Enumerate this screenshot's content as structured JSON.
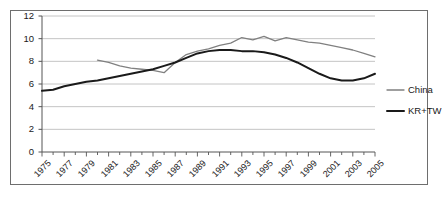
{
  "chart_data": {
    "type": "line",
    "title": "",
    "subtitle": "",
    "xlabel": "",
    "ylabel": "",
    "xlim": [
      1975,
      2005
    ],
    "ylim": [
      0,
      12
    ],
    "ytick_labels": [
      "0",
      "2",
      "4",
      "6",
      "8",
      "10",
      "12"
    ],
    "ytick_values": [
      0,
      2,
      4,
      6,
      8,
      10,
      12
    ],
    "xtick_labels": [
      "1975",
      "1977",
      "1979",
      "1981",
      "1983",
      "1985",
      "1987",
      "1989",
      "1991",
      "1993",
      "1995",
      "1997",
      "1999",
      "2001",
      "2003",
      "2005"
    ],
    "xtick_values": [
      1975,
      1977,
      1979,
      1981,
      1983,
      1985,
      1987,
      1989,
      1991,
      1993,
      1995,
      1997,
      1999,
      2001,
      2003,
      2005
    ],
    "minor_xticks_every": 1,
    "grid": "horizontal",
    "legend_position": "right",
    "x": [
      1975,
      1976,
      1977,
      1978,
      1979,
      1980,
      1981,
      1982,
      1983,
      1984,
      1985,
      1986,
      1987,
      1988,
      1989,
      1990,
      1991,
      1992,
      1993,
      1994,
      1995,
      1996,
      1997,
      1998,
      1999,
      2000,
      2001,
      2002,
      2003,
      2004,
      2005
    ],
    "series": [
      {
        "name": "China",
        "color": "#808080",
        "start_year": 1980,
        "values": [
          null,
          null,
          null,
          null,
          null,
          8.1,
          7.9,
          7.6,
          7.4,
          7.3,
          7.2,
          7.0,
          7.9,
          8.6,
          8.9,
          9.1,
          9.4,
          9.6,
          10.1,
          9.9,
          10.2,
          9.8,
          10.1,
          9.9,
          9.7,
          9.6,
          9.4,
          9.2,
          9.0,
          8.7,
          8.4
        ]
      },
      {
        "name": "KR+TW",
        "color": "#1a1a1a",
        "start_year": 1975,
        "values": [
          5.4,
          5.5,
          5.8,
          6.0,
          6.2,
          6.3,
          6.5,
          6.7,
          6.9,
          7.1,
          7.3,
          7.6,
          7.9,
          8.3,
          8.7,
          8.9,
          9.0,
          9.0,
          8.9,
          8.9,
          8.8,
          8.6,
          8.3,
          7.9,
          7.4,
          6.9,
          6.5,
          6.3,
          6.3,
          6.5,
          6.9
        ]
      }
    ]
  },
  "legend": {
    "items": [
      {
        "label": "China",
        "color": "#808080"
      },
      {
        "label": "KR+TW",
        "color": "#1a1a1a"
      }
    ]
  }
}
